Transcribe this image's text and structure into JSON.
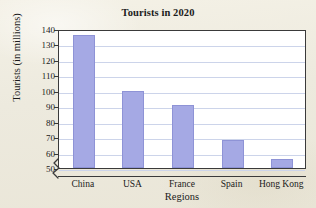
{
  "chart_data": {
    "type": "bar",
    "title": "Tourists in 2020",
    "xlabel": "Regions",
    "ylabel": "Tourists (in millions)",
    "categories": [
      "China",
      "USA",
      "France",
      "Spain",
      "Hong Kong"
    ],
    "values": [
      136,
      100,
      91,
      68,
      56
    ],
    "ylim": [
      50,
      140
    ],
    "ytick_labels": [
      "140",
      "130",
      "120",
      "110",
      "100",
      "90",
      "80",
      "70",
      "60",
      "50"
    ],
    "ytick_values": [
      140,
      130,
      120,
      110,
      100,
      90,
      80,
      70,
      60,
      50
    ],
    "ytick_step": 10,
    "grid": true,
    "legend": "none",
    "axis_break": true,
    "bar_color": "#a5a9e4",
    "bar_edge_color": "#8e93d6",
    "gridline_color": "#ccd4ea",
    "axis_color": "#3a3a3a",
    "plot_background": "#ffffff",
    "page_background": "#efece0"
  }
}
